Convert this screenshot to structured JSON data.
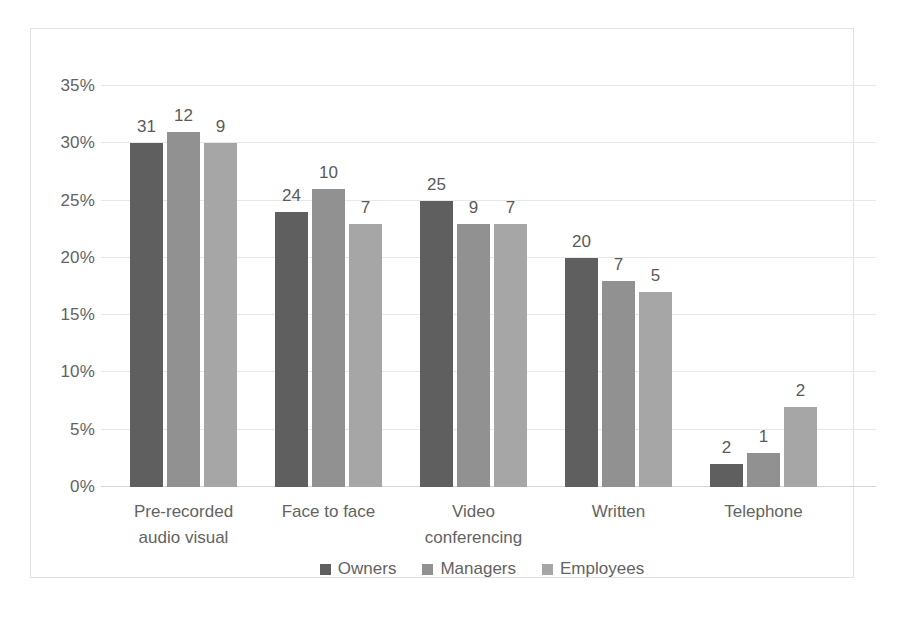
{
  "chart_data": {
    "type": "bar",
    "title": "",
    "xlabel": "",
    "ylabel": "",
    "ylim": [
      0,
      35
    ],
    "ytick_labels": [
      "35%",
      "30%",
      "25%",
      "20%",
      "15%",
      "10%",
      "5%",
      "0%"
    ],
    "ytick_values": [
      35,
      30,
      25,
      20,
      15,
      10,
      5,
      0
    ],
    "grid": true,
    "legend_position": "bottom",
    "categories": [
      "Pre-recorded\naudio visual",
      "Face to face",
      "Video\nconferencing",
      "Written",
      "Telephone"
    ],
    "category_lines": [
      [
        "Pre-recorded",
        "audio visual"
      ],
      [
        "Face to face"
      ],
      [
        "Video",
        "conferencing"
      ],
      [
        "Written"
      ],
      [
        "Telephone"
      ]
    ],
    "series": [
      {
        "name": "Owners",
        "color": "#5f5f5f",
        "values": [
          30,
          24,
          25,
          20,
          2
        ],
        "labels": [
          "31",
          "24",
          "25",
          "20",
          "2"
        ]
      },
      {
        "name": "Managers",
        "color": "#919191",
        "values": [
          31,
          26,
          23,
          18,
          3
        ],
        "labels": [
          "12",
          "10",
          "9",
          "7",
          "1"
        ]
      },
      {
        "name": "Employees",
        "color": "#a6a6a6",
        "values": [
          30,
          23,
          23,
          17,
          7
        ],
        "labels": [
          "9",
          "7",
          "7",
          "5",
          "2"
        ]
      }
    ]
  }
}
